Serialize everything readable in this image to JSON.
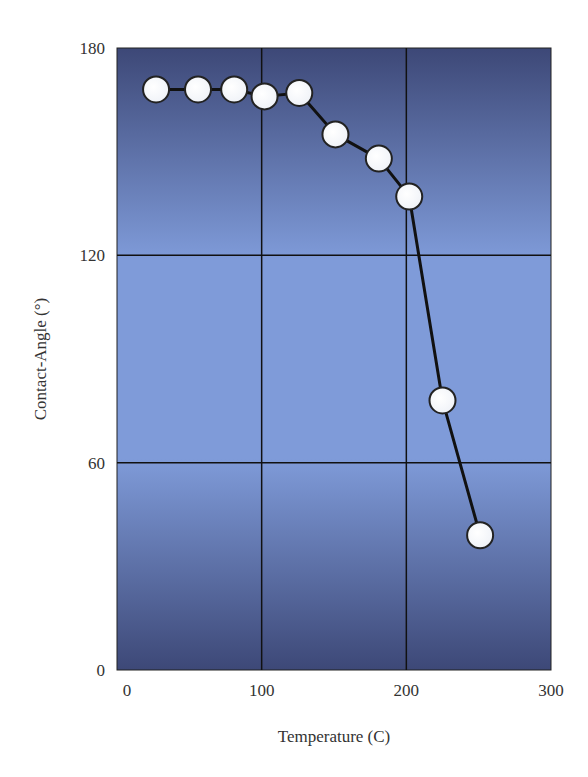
{
  "chart_data": {
    "type": "line",
    "title": "",
    "xlabel": "Temperature (C)",
    "ylabel": "Contact-Angle (°)",
    "xlim": [
      0,
      300
    ],
    "ylim": [
      0,
      180
    ],
    "x_ticks": [
      0,
      100,
      200,
      300
    ],
    "y_ticks": [
      0,
      60,
      120,
      180
    ],
    "grid": true,
    "legend": null,
    "series": [
      {
        "name": "Contact angle",
        "marker": "circle",
        "x": [
          27,
          56,
          81,
          102,
          126,
          151,
          181,
          202,
          225,
          251
        ],
        "y": [
          168,
          168,
          168,
          166,
          167,
          155,
          148,
          137,
          78,
          39
        ]
      }
    ]
  },
  "colors": {
    "plot_dark": "#3d4877",
    "plot_light": "#7f9bd9",
    "line": "#111111",
    "marker_fill": "#ffffff",
    "marker_edge": "#222222",
    "grid": "#111111"
  }
}
